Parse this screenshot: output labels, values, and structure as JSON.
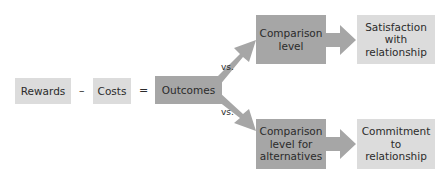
{
  "diagram": {
    "rewards": "Rewards",
    "minus": "–",
    "costs": "Costs",
    "equals": "=",
    "outcomes": "Outcomes",
    "vs_top": "vs.",
    "vs_bottom": "vs.",
    "comparison_level": "Comparison level",
    "comparison_level_alt": "Comparison level for alternatives",
    "satisfaction": "Satisfaction with relationship",
    "commitment": "Commitment to relationship"
  },
  "colors": {
    "light_box": "#dcdcdc",
    "mid_box": "#a6a6a6",
    "arrow": "#a6a6a6"
  }
}
